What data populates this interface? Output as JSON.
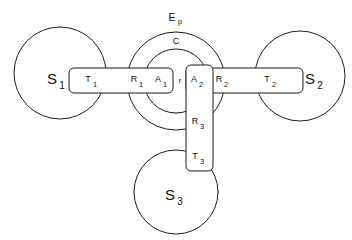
{
  "figure": {
    "background_color": "#ffffff",
    "line_color": "#1a1a1a"
  },
  "outer_region": {
    "label": "E",
    "label_subscript": "p",
    "name": "outer-envelope-circle"
  },
  "inner_region": {
    "label": "C",
    "name": "inner-core-circle"
  },
  "gap": {
    "label": "r"
  },
  "terminals": [
    {
      "id": "s1",
      "label": "S",
      "subscript": "1",
      "position": "left"
    },
    {
      "id": "s2",
      "label": "S",
      "subscript": "2",
      "position": "right"
    },
    {
      "id": "s3",
      "label": "S",
      "subscript": "3",
      "position": "bottom"
    }
  ],
  "branch_left": {
    "segments": [
      {
        "label": "T",
        "subscript": "1"
      },
      {
        "label": "R",
        "subscript": "1"
      },
      {
        "label": "A",
        "subscript": "1"
      }
    ]
  },
  "branch_right": {
    "segments": [
      {
        "label": "A",
        "subscript": "2"
      },
      {
        "label": "R",
        "subscript": "2"
      },
      {
        "label": "T",
        "subscript": "2"
      }
    ]
  },
  "branch_bottom": {
    "segments": [
      {
        "label": "A",
        "subscript": "2"
      },
      {
        "label": "R",
        "subscript": "3"
      },
      {
        "label": "T",
        "subscript": "3"
      }
    ]
  }
}
